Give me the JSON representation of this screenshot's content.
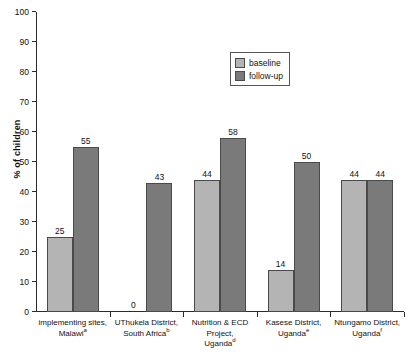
{
  "chart_data": {
    "type": "bar",
    "title": "",
    "xlabel": "",
    "ylabel": "% of children",
    "ylim": [
      0,
      100
    ],
    "ytick_step": 10,
    "yticks": [
      100,
      90,
      80,
      70,
      60,
      50,
      40,
      30,
      20,
      10,
      0
    ],
    "grid": false,
    "legend_position": "top-right-inside",
    "categories": [
      "implementing sites, Malawi",
      "UThukela District, South Africa",
      "Nutrition & ECD Project, Uganda",
      "Kasese District, Uganda",
      "Ntungamo District, Uganda"
    ],
    "category_lines": [
      [
        "implementing sites,",
        "Malawi"
      ],
      [
        "UThukela District,",
        "South Africa"
      ],
      [
        "Nutrition & ECD",
        "Project,",
        "Uganda"
      ],
      [
        "Kasese District,",
        "Uganda"
      ],
      [
        "Ntungamo District,",
        "Uganda"
      ]
    ],
    "category_footnotes": [
      "a",
      "b",
      "d",
      "e",
      "f"
    ],
    "series": [
      {
        "name": "baseline",
        "color": "#b4b4b4",
        "values": [
          25,
          0,
          44,
          14,
          44
        ]
      },
      {
        "name": "follow-up",
        "color": "#7a7a7a",
        "values": [
          55,
          43,
          58,
          50,
          44
        ]
      }
    ]
  },
  "legend": {
    "items": [
      {
        "label": "baseline",
        "swatch": "legend-swatch-baseline"
      },
      {
        "label": "follow-up",
        "swatch": "legend-swatch-followup"
      }
    ]
  },
  "axis": {
    "y_label": "% of children"
  }
}
